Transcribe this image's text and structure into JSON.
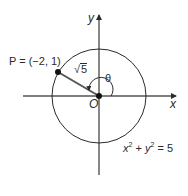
{
  "diagram": {
    "type": "unit-circle-angle",
    "axes": {
      "x_label": "x",
      "y_label": "y",
      "origin_label": "O"
    },
    "point": {
      "label": "P = (−2, 1)",
      "x": -2,
      "y": 1
    },
    "radius": {
      "label_radical": "√",
      "label_value": "5"
    },
    "angle": {
      "label": "θ"
    },
    "circle": {
      "equation_x": "x",
      "equation_mid": " + ",
      "equation_y": "y",
      "equation_exp": "2",
      "equation_rhs": " = 5"
    },
    "colors": {
      "stroke": "#2a2a2a",
      "radius_segment": "#555555",
      "background": "#ffffff"
    }
  }
}
